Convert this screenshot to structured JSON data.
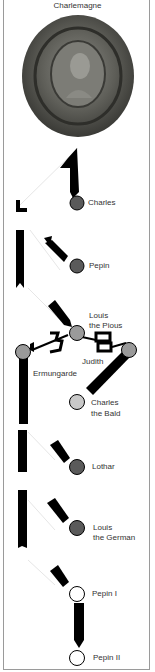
{
  "title": "Charlemagne",
  "colors": {
    "dark_gray": "#5a5a5a",
    "mid_gray": "#9a9a9a",
    "light_gray": "#c8c8c8",
    "white": "#ffffff",
    "line": "#000000"
  },
  "people": [
    {
      "name": "Charles",
      "line1": "Charles",
      "line2": "",
      "shade": "dark"
    },
    {
      "name": "Pepin",
      "line1": "Pepin",
      "line2": "",
      "shade": "dark"
    },
    {
      "name": "Louis the Pious",
      "line1": "Louis",
      "line2": "the Pious",
      "shade": "mid"
    },
    {
      "name": "Judith",
      "line1": "Judith",
      "line2": "",
      "shade": "mid"
    },
    {
      "name": "Ermungarde",
      "line1": "Ermungarde",
      "line2": "",
      "shade": "mid"
    },
    {
      "name": "Charles the Bald",
      "line1": "Charles",
      "line2": "the Bald",
      "shade": "light"
    },
    {
      "name": "Lothar",
      "line1": "Lothar",
      "line2": "",
      "shade": "dark"
    },
    {
      "name": "Louis the German",
      "line1": "Louis",
      "line2": "the German",
      "shade": "dark"
    },
    {
      "name": "Pepin I",
      "line1": "Pepin I",
      "line2": "",
      "shade": "white"
    },
    {
      "name": "Pepin II",
      "line1": "Pepin II",
      "line2": "",
      "shade": "white"
    }
  ]
}
